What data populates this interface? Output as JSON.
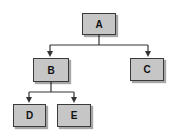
{
  "diagram": {
    "type": "tree",
    "colors": {
      "node_fill": "#c6c6c6",
      "node_border": "#3a3a3a",
      "connector": "#333333",
      "text": "#111111"
    },
    "nodes": [
      {
        "id": "A",
        "label": "A"
      },
      {
        "id": "B",
        "label": "B"
      },
      {
        "id": "C",
        "label": "C"
      },
      {
        "id": "D",
        "label": "D"
      },
      {
        "id": "E",
        "label": "E"
      }
    ],
    "edges": [
      {
        "from": "A",
        "to": "B"
      },
      {
        "from": "A",
        "to": "C"
      },
      {
        "from": "B",
        "to": "D"
      },
      {
        "from": "B",
        "to": "E"
      }
    ]
  }
}
